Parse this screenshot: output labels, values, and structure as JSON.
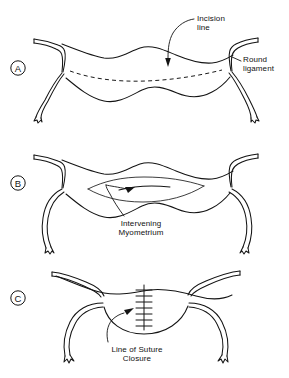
{
  "figure": {
    "background_color": "#ffffff",
    "line_color": "#141414",
    "width": 289,
    "height": 378
  },
  "panels": [
    {
      "id": "panel-a",
      "letter": "A",
      "label_x": 18,
      "label_y": 68,
      "description": "Uterus with dashed incision line across the fundus, round ligaments extending bilaterally",
      "callouts": [
        {
          "id": "incision-line",
          "text": "Incision\nline",
          "x": 197,
          "y": 14,
          "align": "left"
        },
        {
          "id": "round-ligament",
          "text": "Round\nligament",
          "x": 243,
          "y": 55,
          "align": "left"
        }
      ]
    },
    {
      "id": "panel-b",
      "letter": "B",
      "label_x": 18,
      "label_y": 183,
      "description": "Incision opened revealing the intervening myometrium between the separated edges",
      "callouts": [
        {
          "id": "intervening-myometrium",
          "text": "Intervening\nMyometrium",
          "x": 104,
          "y": 219,
          "align": "center"
        }
      ]
    },
    {
      "id": "panel-c",
      "letter": "C",
      "label_x": 18,
      "label_y": 298,
      "description": "Closed uterus with a vertical line of interrupted suture closure",
      "callouts": [
        {
          "id": "line-of-suture-closure",
          "text": "Line of Suture\nClosure",
          "x": 97,
          "y": 345,
          "align": "center"
        }
      ]
    }
  ]
}
